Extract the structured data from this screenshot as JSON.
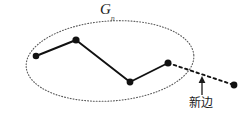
{
  "figure": {
    "width": 247,
    "height": 115,
    "background_color": "#ffffff",
    "ink_color": "#111111",
    "boundary_color": "#555555"
  },
  "labels": {
    "graph_label_base": "G",
    "graph_label_subscript": "n",
    "new_edge_label": "新边",
    "arrow_glyph": "↑"
  },
  "diagram_data": {
    "type": "node-link-diagram",
    "region_boundary": {
      "shape": "ellipse",
      "style": "dotted",
      "center_x": 110,
      "center_y": 61,
      "radius_x": 84,
      "radius_y": 40,
      "rotation_deg": -4
    },
    "nodes": [
      {
        "id": "v1",
        "x": 36,
        "y": 56,
        "inside_region": true
      },
      {
        "id": "v2",
        "x": 76,
        "y": 40,
        "inside_region": true
      },
      {
        "id": "v3",
        "x": 130,
        "y": 82,
        "inside_region": true
      },
      {
        "id": "v4",
        "x": 168,
        "y": 63,
        "inside_region": true
      },
      {
        "id": "v5",
        "x": 234,
        "y": 85,
        "inside_region": false
      }
    ],
    "edges": [
      {
        "from": "v1",
        "to": "v2",
        "style": "solid"
      },
      {
        "from": "v2",
        "to": "v3",
        "style": "solid"
      },
      {
        "from": "v3",
        "to": "v4",
        "style": "solid"
      },
      {
        "from": "v4",
        "to": "v5",
        "style": "dashed",
        "annotated_as": "新边"
      }
    ],
    "annotation": {
      "text": "新边",
      "arrow_from_x": 202,
      "arrow_from_y": 95,
      "arrow_to_x": 202,
      "arrow_to_y": 79,
      "points_at_edge": "v4-v5"
    }
  }
}
